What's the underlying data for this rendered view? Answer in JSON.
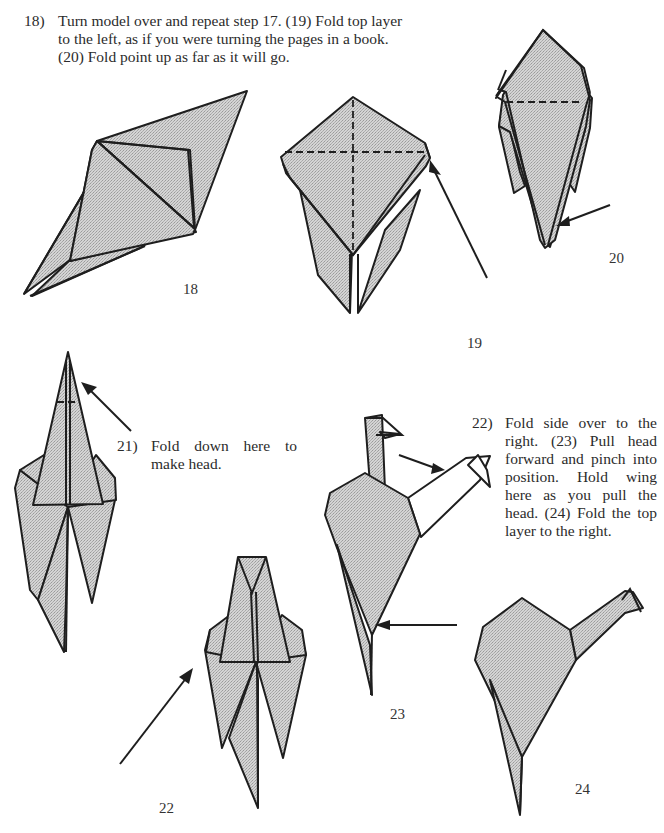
{
  "instructions": {
    "step18": {
      "number": "18)",
      "text": "Turn model over and repeat step 17. (19) Fold top layer to the left, as if you were turning the pages in a book. (20) Fold point up as far as it will go."
    },
    "step21": {
      "number": "21)",
      "text": "Fold down here to make head."
    },
    "step22": {
      "number": "22)",
      "text": "Fold side over to the right. (23) Pull head forward and pinch into position. Hold wing here as you pull the head. (24) Fold the top layer to the right."
    }
  },
  "figure_labels": {
    "fig18": "18",
    "fig19": "19",
    "fig20": "20",
    "fig22": "22",
    "fig23": "23",
    "fig24": "24"
  },
  "icons": {
    "fold_arrow": "arrow-icon",
    "valley_fold_line": "dashed-line",
    "paper_fill": "#c8c8c8",
    "line_color": "#1e1e1e"
  }
}
